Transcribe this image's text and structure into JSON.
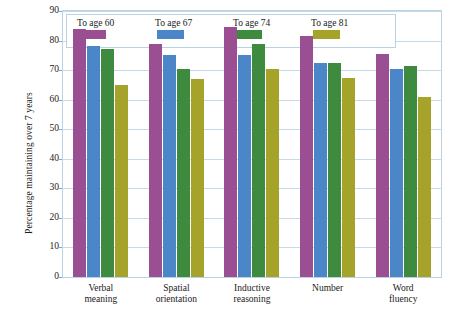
{
  "chart_data": {
    "type": "bar",
    "title": "",
    "xlabel": "",
    "ylabel": "Percentage maintaining over 7 years",
    "ylim": [
      0,
      90
    ],
    "ytick_labels": [
      "0",
      "10",
      "20",
      "30",
      "40",
      "50",
      "60",
      "70",
      "80",
      "90"
    ],
    "ytick_values": [
      0,
      10,
      20,
      30,
      40,
      50,
      60,
      70,
      80,
      90
    ],
    "grid": true,
    "legend_position": "top-left-inside",
    "categories": [
      "Verbal\nmeaning",
      "Spatial\norientation",
      "Inductive\nreasoning",
      "Number",
      "Word\nfluency"
    ],
    "category_lines": [
      [
        "Verbal",
        "meaning"
      ],
      [
        "Spatial",
        "orientation"
      ],
      [
        "Inductive",
        "reasoning"
      ],
      [
        "Number",
        ""
      ],
      [
        "Word",
        "fluency"
      ]
    ],
    "series": [
      {
        "name": "To age 60",
        "color": "#9a4f92",
        "values": [
          84,
          79,
          84.5,
          81.5,
          75.5
        ]
      },
      {
        "name": "To age 67",
        "color": "#4a86c8",
        "values": [
          78,
          75,
          75,
          72.5,
          70.5
        ]
      },
      {
        "name": "To age 74",
        "color": "#3e8a3f",
        "values": [
          77,
          70.5,
          79,
          72.5,
          71.5
        ]
      },
      {
        "name": "To age 81",
        "color": "#a5a32a",
        "values": [
          65,
          67,
          70.5,
          67.5,
          61
        ]
      }
    ]
  },
  "axes": {
    "y_title": "Percentage maintaining over 7 years"
  },
  "style": {
    "frame_border": "#b9d2e4",
    "gridline": "#c6dbea",
    "background": "#ffffff",
    "text": "#1a1a1a"
  }
}
